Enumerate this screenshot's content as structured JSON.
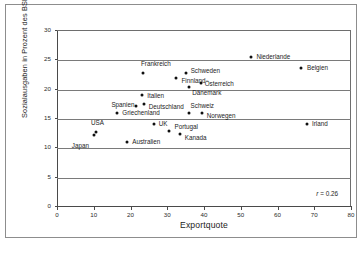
{
  "chart_data": {
    "type": "scatter",
    "title": "",
    "xlabel": "Exportquote",
    "ylabel": "Sozialausgaben in Prozent des BSP",
    "xlim": [
      0,
      80
    ],
    "ylim": [
      0,
      30
    ],
    "xticks": [
      0,
      10,
      20,
      30,
      40,
      50,
      60,
      70,
      80
    ],
    "yticks": [
      0,
      5,
      10,
      15,
      20,
      25,
      30
    ],
    "grid": "horizontal",
    "legend": "none",
    "annotation": {
      "symbol": "r",
      "equals": " = ",
      "value": "0.26",
      "text": "r = 0.26"
    },
    "points": [
      {
        "label": "Japan",
        "x": 10.0,
        "y": 12.2,
        "label_dx": -22,
        "label_dy": 11
      },
      {
        "label": "USA",
        "x": 10.6,
        "y": 12.7,
        "label_dx": -5,
        "label_dy": -9
      },
      {
        "label": "Griechenland",
        "x": 16.4,
        "y": 16.1,
        "label_dx": 5,
        "label_dy": 0
      },
      {
        "label": "Australien",
        "x": 19.1,
        "y": 11.1,
        "label_dx": 5,
        "label_dy": 0
      },
      {
        "label": "Spanien",
        "x": 21.6,
        "y": 17.3,
        "label_dx": -25,
        "label_dy": -1
      },
      {
        "label": "Italien",
        "x": 23.2,
        "y": 19.1,
        "label_dx": 5,
        "label_dy": 1
      },
      {
        "label": "Frankreich",
        "x": 23.4,
        "y": 22.9,
        "label_dx": -2,
        "label_dy": -9
      },
      {
        "label": "Deutschland",
        "x": 23.6,
        "y": 17.6,
        "label_dx": 5,
        "label_dy": 3
      },
      {
        "label": "UK",
        "x": 26.3,
        "y": 14.1,
        "label_dx": 5,
        "label_dy": 0
      },
      {
        "label": "Portugal",
        "x": 30.6,
        "y": 12.9,
        "label_dx": 5,
        "label_dy": -4
      },
      {
        "label": "Finnland",
        "x": 32.5,
        "y": 22.0,
        "label_dx": 5,
        "label_dy": 3
      },
      {
        "label": "Kanada",
        "x": 33.4,
        "y": 12.5,
        "label_dx": 5,
        "label_dy": 4
      },
      {
        "label": "Schweden",
        "x": 35.0,
        "y": 22.9,
        "label_dx": 5,
        "label_dy": -2
      },
      {
        "label": "Schweiz",
        "x": 35.8,
        "y": 16.0,
        "label_dx": 2,
        "label_dy": -7
      },
      {
        "label": "Dänemark",
        "x": 36.0,
        "y": 20.5,
        "label_dx": 3,
        "label_dy": 6
      },
      {
        "label": "Österreich",
        "x": 39.1,
        "y": 21.1,
        "label_dx": 4,
        "label_dy": 1
      },
      {
        "label": "Norwegen",
        "x": 39.4,
        "y": 16.0,
        "label_dx": 5,
        "label_dy": 3
      },
      {
        "label": "Niederlande",
        "x": 52.9,
        "y": 25.6,
        "label_dx": 5,
        "label_dy": 0
      },
      {
        "label": "Belgien",
        "x": 66.4,
        "y": 23.7,
        "label_dx": 6,
        "label_dy": 0
      },
      {
        "label": "Irland",
        "x": 68.0,
        "y": 14.2,
        "label_dx": 5,
        "label_dy": 0
      }
    ]
  }
}
